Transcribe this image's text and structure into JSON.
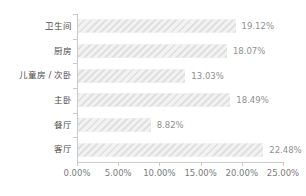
{
  "chart_data": {
    "type": "bar",
    "orientation": "horizontal",
    "title": "",
    "subtitle": "",
    "xlabel": "",
    "ylabel": "",
    "categories": [
      "卫生间",
      "厨房",
      "儿童房 / 次卧",
      "主卧",
      "餐厅",
      "客厅"
    ],
    "values": [
      19.12,
      18.07,
      13.03,
      18.49,
      8.82,
      22.48
    ],
    "value_labels": [
      "19.12%",
      "18.07%",
      "13.03%",
      "18.49%",
      "8.82%",
      "22.48%"
    ],
    "xlim": [
      0,
      25
    ],
    "xticks": [
      0,
      5,
      10,
      15,
      20,
      25
    ],
    "xtick_labels": [
      "0.00%",
      "5.00%",
      "10.00%",
      "15.00%",
      "20.00%",
      "25.00%"
    ],
    "grid": false,
    "legend": null,
    "bar_fill": "#e8e8e8",
    "bar_hatch": "diagonal-stripes",
    "axis_color": "#c9c9c9",
    "label_color": "#4d4d4d",
    "value_color": "#8f8f8f",
    "tick_label_color": "#7a7a7a",
    "background": "#ffffff"
  }
}
